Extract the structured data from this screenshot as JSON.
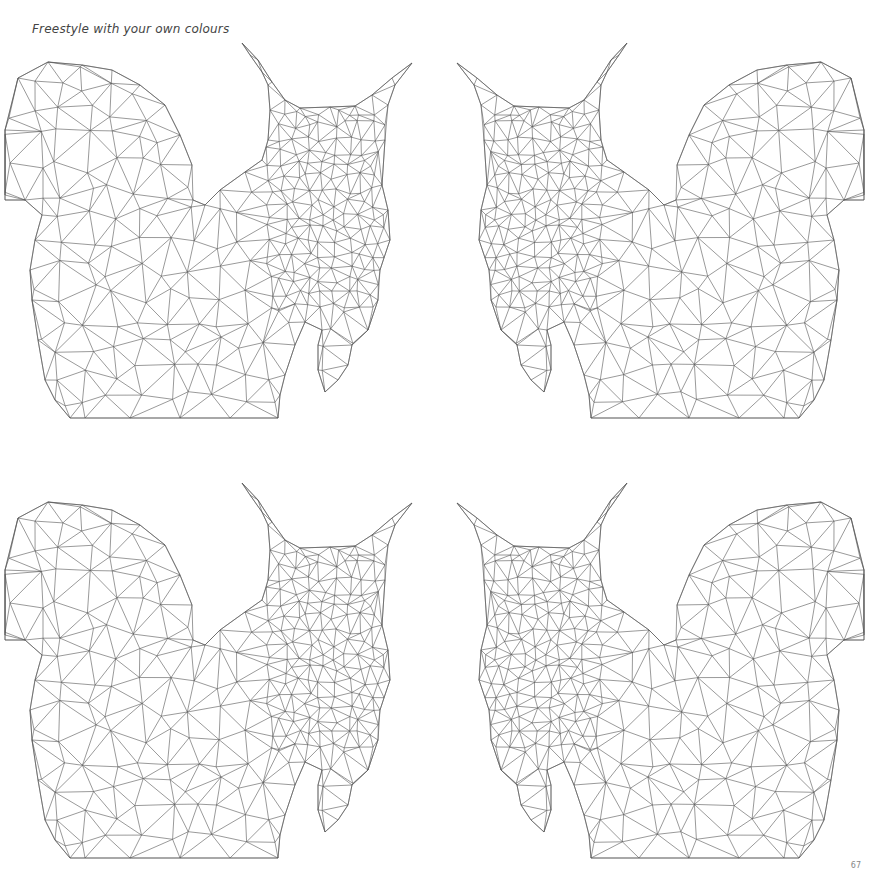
{
  "page": {
    "title": "Freestyle with your own colours",
    "page_number": "67"
  },
  "illustration": {
    "subject": "low-poly triangulated squirrel outline",
    "count": 4,
    "line_color": "#555555",
    "background": "#ffffff",
    "panels": [
      {
        "name": "squirrel-top-left",
        "mirrored": false,
        "offset_x": 0,
        "offset_y": 0
      },
      {
        "name": "squirrel-top-right",
        "mirrored": true,
        "offset_x": 869,
        "offset_y": 0
      },
      {
        "name": "squirrel-bottom-left",
        "mirrored": false,
        "offset_x": 0,
        "offset_y": 440
      },
      {
        "name": "squirrel-bottom-right",
        "mirrored": true,
        "offset_x": 869,
        "offset_y": 440
      }
    ]
  }
}
